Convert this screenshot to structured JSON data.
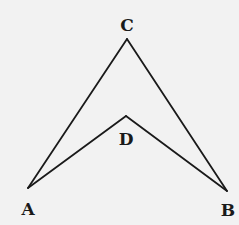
{
  "diagram": {
    "type": "geometry",
    "stroke_color": "#1a1a1a",
    "background_color": "#f2f2f2",
    "points": {
      "A": {
        "label": "A",
        "x": 28,
        "y": 188,
        "label_x": 28,
        "label_y": 209
      },
      "B": {
        "label": "B",
        "x": 227,
        "y": 191,
        "label_x": 228,
        "label_y": 210
      },
      "C": {
        "label": "C",
        "x": 127,
        "y": 39,
        "label_x": 127,
        "label_y": 25
      },
      "D": {
        "label": "D",
        "x": 126,
        "y": 116,
        "label_x": 126,
        "label_y": 139
      }
    },
    "segments": [
      [
        "A",
        "C"
      ],
      [
        "C",
        "B"
      ],
      [
        "A",
        "D"
      ],
      [
        "D",
        "B"
      ]
    ]
  }
}
